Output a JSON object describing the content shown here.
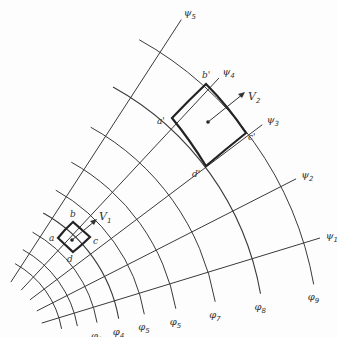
{
  "diagram": {
    "type": "flow-net",
    "origin": [
      -30,
      345
    ],
    "stream_lines": [
      {
        "symbol": "ψ",
        "sub": "1",
        "angle_deg": 17
      },
      {
        "symbol": "ψ",
        "sub": "2",
        "angle_deg": 27
      },
      {
        "symbol": "ψ",
        "sub": "3",
        "angle_deg": 37
      },
      {
        "symbol": "ψ",
        "sub": "4",
        "angle_deg": 47
      },
      {
        "symbol": "ψ",
        "sub": "5",
        "angle_deg": 57
      }
    ],
    "potential_lines": [
      {
        "symbol": "φ",
        "sub": "1",
        "radius": 93
      },
      {
        "symbol": "φ",
        "sub": "2",
        "radius": 109
      },
      {
        "symbol": "φ",
        "sub": "3",
        "radius": 129
      },
      {
        "symbol": "φ",
        "sub": "4",
        "radius": 151
      },
      {
        "symbol": "φ",
        "sub": "5",
        "radius": 177
      },
      {
        "symbol": "φ",
        "sub": "5",
        "radius": 209
      },
      {
        "symbol": "φ",
        "sub": "7",
        "radius": 249
      },
      {
        "symbol": "φ",
        "sub": "8",
        "radius": 295
      },
      {
        "symbol": "φ",
        "sub": "9",
        "radius": 349
      }
    ],
    "small_element": {
      "corners": {
        "a": "a",
        "b": "b",
        "c": "c",
        "d": "d"
      },
      "velocity": {
        "symbol": "V",
        "sub": "1"
      }
    },
    "large_element": {
      "corners": {
        "a": "a'",
        "b": "b'",
        "c": "c'",
        "d": "d'"
      },
      "velocity": {
        "symbol": "V",
        "sub": "2"
      }
    },
    "line_color": "#3a3a3a"
  }
}
